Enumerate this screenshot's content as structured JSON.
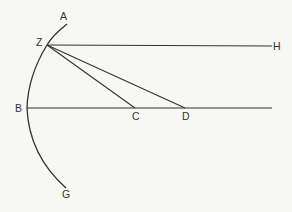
{
  "diagram": {
    "type": "geometric-construction",
    "colors": {
      "background": "#f7f7f5",
      "ink": "#333333"
    },
    "points": [
      {
        "id": "A",
        "label": "A"
      },
      {
        "id": "Z",
        "label": "Z"
      },
      {
        "id": "H",
        "label": "H"
      },
      {
        "id": "B",
        "label": "B"
      },
      {
        "id": "C",
        "label": "C"
      },
      {
        "id": "D",
        "label": "D"
      },
      {
        "id": "G",
        "label": "G"
      }
    ],
    "curves": [
      {
        "id": "arc-AG",
        "through": [
          "A",
          "Z",
          "B",
          "G"
        ],
        "kind": "circular-arc"
      }
    ],
    "segments": [
      {
        "id": "ZH",
        "from": "Z",
        "to": "H"
      },
      {
        "id": "BD-extended",
        "from": "B",
        "to": "end",
        "through": [
          "C",
          "D"
        ]
      },
      {
        "id": "ZC",
        "from": "Z",
        "to": "C"
      },
      {
        "id": "ZD",
        "from": "Z",
        "to": "D"
      }
    ]
  }
}
